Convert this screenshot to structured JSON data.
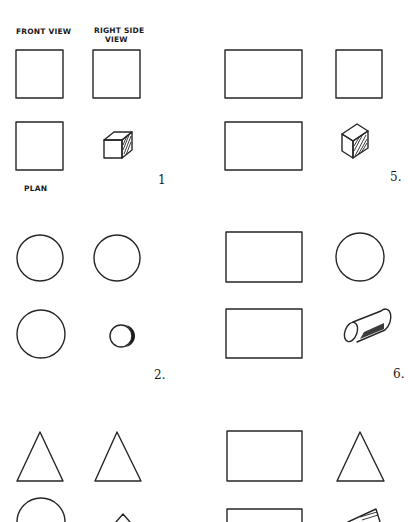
{
  "labels": {
    "front_view": "FRONT VIEW",
    "right_side_view_line1": "RIGHT SIDE",
    "right_side_view_line2": "VIEW",
    "plan": "PLAN"
  },
  "exercises": [
    {
      "number": "1",
      "solid": "cube",
      "front": "square",
      "side": "square",
      "plan": "square"
    },
    {
      "number": "2.",
      "solid": "sphere",
      "front": "circle",
      "side": "circle",
      "plan": "circle"
    },
    {
      "number": "3",
      "solid": "cone",
      "front": "triangle",
      "side": "triangle",
      "plan": "circle",
      "partially_visible": true
    },
    {
      "number": "5.",
      "solid": "rectangular-prism",
      "front": "rectangle",
      "side": "square",
      "plan": "rectangle"
    },
    {
      "number": "6.",
      "solid": "cylinder",
      "front": "rectangle",
      "side": "circle",
      "plan": "rectangle"
    },
    {
      "number": "7",
      "solid": "triangular-prism",
      "front": "rectangle",
      "side": "triangle",
      "plan": "rectangle",
      "partially_visible": true
    }
  ],
  "colors": {
    "ink": "#262626",
    "paper": "#ffffff"
  }
}
